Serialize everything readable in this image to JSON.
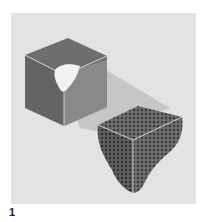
{
  "figure": {
    "label": "1",
    "colors": {
      "background": "#ffffff",
      "panel": "#e3e3e3",
      "cube_top": "#6e6e6e",
      "cube_left": "#666666",
      "cube_right": "#8c8c8c",
      "cutout": "#f4f4f4",
      "beam": "#c6c6c6",
      "chunk_fill": "#6a6a6a",
      "chunk_dots": "#3a3a3a",
      "edge_highlight": "#cfcfcf"
    }
  }
}
